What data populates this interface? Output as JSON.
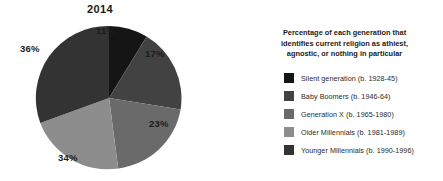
{
  "chart_data": {
    "type": "pie",
    "title": "2014",
    "xlabel": "",
    "ylabel": "",
    "legend_position": "right",
    "grid": false,
    "categories": [
      "Silent generation (b. 1928-45)",
      "Baby Boomers (b. 1946-64)",
      "Generation X (b. 1965-1980)",
      "Older Millennials (b. 1981-1989)",
      "Younger Millennials (b. 1990-1996)"
    ],
    "values": [
      11,
      17,
      23,
      34,
      36
    ],
    "value_labels": [
      "11%",
      "17%",
      "23%",
      "34%",
      "36%"
    ],
    "unit": "%",
    "colors": [
      "#151515",
      "#424242",
      "#6a6a6a",
      "#8d8d8d",
      "#333333"
    ],
    "legend_title": "Percentage of each generation that identifies current religion as athiest, agnostic, or nothing in particular",
    "start_angle_deg": 0,
    "direction": "clockwise",
    "note": "Slice percentages sum to 121 as printed in the source graphic; each value is an independent per-generation share."
  },
  "figure": {
    "title": "2014",
    "legend": {
      "title_line1": "Percentage of each generation that",
      "title_line2": "identifies current religion as athiest,",
      "title_line3": "agnostic, or nothing in particular",
      "items": [
        {
          "label": "Silent generation (b. 1928-45)",
          "color": "#151515",
          "value_label": "11%"
        },
        {
          "label": "Baby Boomers (b. 1946-64)",
          "color": "#424242",
          "value_label": "17%"
        },
        {
          "label": "Generation X (b. 1965-1980)",
          "color": "#6a6a6a",
          "value_label": "23%"
        },
        {
          "label": "Older Millennials (b. 1981-1989)",
          "color": "#8d8d8d",
          "value_label": "34%"
        },
        {
          "label": "Younger Millennials (b. 1990-1996)",
          "color": "#333333",
          "value_label": "36%"
        }
      ]
    },
    "slice_labels": {
      "silent": "11%",
      "boomers": "17%",
      "genx": "23%",
      "older_millennials": "34%",
      "younger_millennials": "36%"
    },
    "background_color": "#ffffff",
    "text_color": "#1b1b1b"
  }
}
